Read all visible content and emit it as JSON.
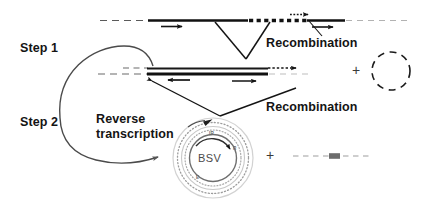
{
  "figure": {
    "background_color": "#ffffff",
    "ink_color": "#141414",
    "faint_color": "#9a9a9a"
  },
  "labels": {
    "step1": "Step 1",
    "step2": "Step 2",
    "recombination_top": "Recombination",
    "recombination_bottom": "Recombination",
    "reverse_transcription_line1": "Reverse",
    "reverse_transcription_line2": "transcription",
    "plus_middle": "+",
    "plus_bottom": "+",
    "bsv_core": "BSV",
    "ring_top": "IR",
    "ring_right": "R",
    "ring_bottom": "E"
  },
  "diagram_elements": {
    "top_row": {
      "description": "Upper chromosomal DNA duplex with integrated viral segment",
      "dashed_left_segment": true,
      "solid_thick_segment": true,
      "bold_dotted_segment": true,
      "faint_dashed_right_segment": true,
      "arrow_left_label": "leftward primer arrow",
      "arrow_mid_label": "small dotted arrow",
      "arrow_right_label": "rightward primer arrow"
    },
    "middle_row": {
      "description": "Recombined episomal duplex with free dashed circle product",
      "dashed_left_segment": true,
      "solid_double_line": true,
      "dashed_circle_product": true
    },
    "bottom_row": {
      "description": "BSV circular genome with concentric dotted rings plus free dashed linear product",
      "circle_label": "BSV",
      "dashed_linear_product": true
    },
    "v_junction_top": "V-shaped recombination junction linking upper duplex to middle duplex",
    "v_junction_bottom": "V-shaped recombination junction linking middle duplex to BSV circle",
    "curved_arrow_step1": "large curved arrow from Step 1 region sweeping right",
    "curved_arrow_step2": "large curved arrow from Step 2 region sweeping to BSV circle"
  }
}
